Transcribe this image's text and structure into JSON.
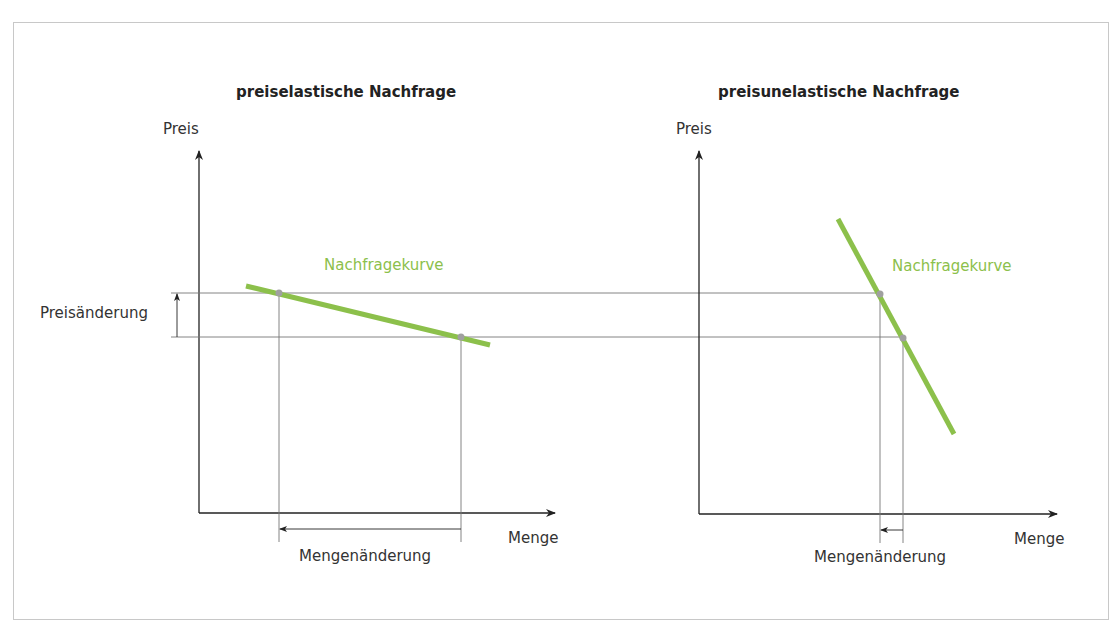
{
  "left_chart": {
    "title": "preiselastische Nachfrage",
    "y_axis_label": "Preis",
    "x_axis_label": "Menge",
    "curve_label": "Nachfragekurve",
    "price_change_label": "Preisänderung",
    "quantity_change_label": "Mengenänderung"
  },
  "right_chart": {
    "title": "preisunelastische Nachfrage",
    "y_axis_label": "Preis",
    "x_axis_label": "Menge",
    "curve_label": "Nachfragekurve",
    "quantity_change_label": "Mengenänderung"
  },
  "colors": {
    "curve": "#8cc04b",
    "axis": "#222222",
    "guide": "#777777",
    "point": "#a0a0a0"
  }
}
